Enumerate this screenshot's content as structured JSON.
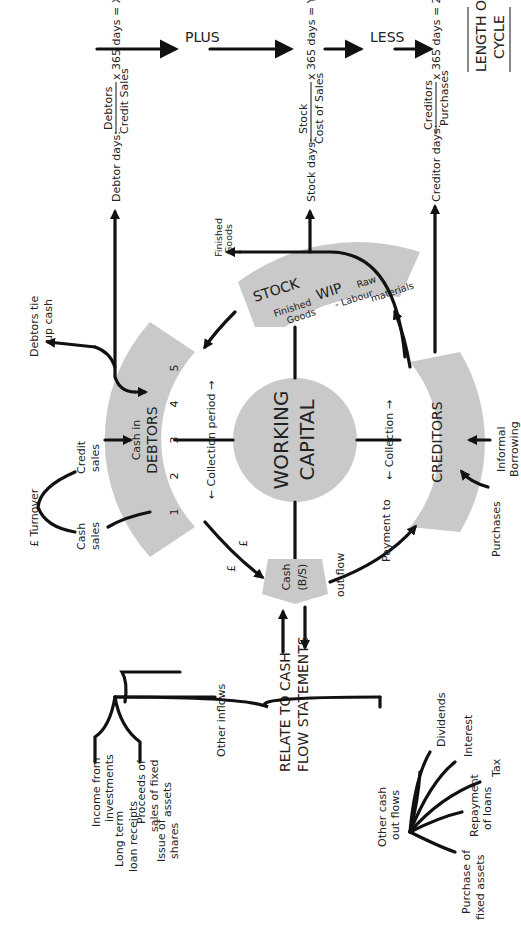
{
  "diagram": {
    "center": {
      "line1": "WORKING",
      "line2": "CAPITAL"
    },
    "debtors": {
      "line1": "Cash in",
      "line2": "DEBTORS",
      "periods": [
        "1",
        "2",
        "3",
        "4",
        "5"
      ],
      "collection_label": "← Collection period →"
    },
    "stock": {
      "title": "STOCK",
      "items": [
        "Finished",
        "Goods",
        "WIP",
        "- Labour",
        "Raw",
        "materials"
      ],
      "finished_goods_out": [
        "Finished",
        "Goods"
      ]
    },
    "creditors": {
      "title": "CREDITORS",
      "collection_label": "← Collection →",
      "inputs": {
        "purchases": "Purchases",
        "informal": [
          "Informal",
          "Borrowing"
        ]
      }
    },
    "cash": {
      "line1": "Cash",
      "line2": "(B/S)",
      "pound1": "£",
      "pound2": "£"
    },
    "payment": {
      "out_flow": "out flow",
      "payment_to": "Payment to"
    },
    "sales": {
      "turnover": "£ Turnover",
      "cash_sales": [
        "Cash",
        "sales"
      ],
      "credit_sales": [
        "Credit",
        "sales"
      ],
      "debtors_tie": [
        "Debtors tie",
        "up cash"
      ]
    },
    "formulas": {
      "debtor": {
        "label": "Debtor days:",
        "numerator": "Debtors",
        "denominator": "Credit Sales",
        "result": "x 365 days = X days"
      },
      "stock": {
        "label": "Stock days:",
        "numerator": "Stock",
        "denominator": "Cost of Sales",
        "result": "x 365 days = Y days"
      },
      "creditor": {
        "label": "Creditor days:",
        "numerator": "Creditors",
        "denominator": "Purchases",
        "result": "x 365 days = Z days"
      }
    },
    "operators": {
      "plus": "PLUS",
      "less": "LESS",
      "result": [
        "LENGTH OF",
        "CYCLE"
      ]
    },
    "cash_flow": {
      "title": [
        "RELATE TO CASH",
        "FLOW STATEMENTS"
      ],
      "other_inflows": "Other inflows",
      "inflows": [
        [
          "Income from",
          "investments"
        ],
        [
          "Proceeds of",
          "sales of fixed",
          "assets"
        ],
        [
          "Long term",
          "loan receipts"
        ],
        [
          "Issue of",
          "shares"
        ]
      ],
      "other_outflows": [
        "Other cash",
        "out flows"
      ],
      "outflows": [
        [
          "Dividends"
        ],
        [
          "Interest"
        ],
        [
          "Tax"
        ],
        [
          "Repayment",
          "of loans"
        ],
        [
          "Purchase of",
          "fixed assets"
        ]
      ]
    },
    "colors": {
      "shape_fill": "#c9c9c9",
      "line": "#111111",
      "background": "#ffffff"
    }
  }
}
